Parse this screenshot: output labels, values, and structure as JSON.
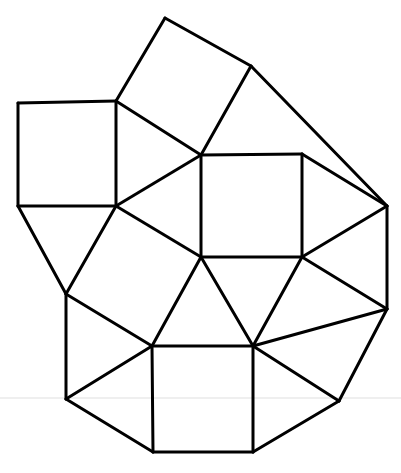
{
  "figure": {
    "background_color": "#ffffff",
    "stroke_color": "#000000",
    "stroke_width": 3,
    "canvas": {
      "width": 401,
      "height": 473
    },
    "artifact": {
      "name": "scan-line",
      "color": "#efefef",
      "y": 398,
      "x1": 0,
      "x2": 401
    },
    "vertices": {
      "A": [
        165,
        18
      ],
      "B": [
        251,
        66
      ],
      "C": [
        116,
        101
      ],
      "D": [
        18,
        103
      ],
      "E": [
        201,
        155
      ],
      "F": [
        302,
        154
      ],
      "G": [
        18,
        206
      ],
      "H": [
        116,
        206
      ],
      "I": [
        387,
        206
      ],
      "J": [
        66,
        294
      ],
      "K": [
        201,
        257
      ],
      "L": [
        302,
        257
      ],
      "M": [
        387,
        309
      ],
      "N": [
        152,
        346
      ],
      "O": [
        253,
        346
      ],
      "P": [
        66,
        399
      ],
      "Q": [
        339,
        401
      ],
      "R": [
        153,
        452
      ],
      "S": [
        253,
        452
      ]
    },
    "faces": [
      {
        "name": "tilted-square-top",
        "type": "square",
        "points": "A,B,E,C"
      },
      {
        "name": "square-upper-left",
        "type": "square",
        "points": "D,C,H,G"
      },
      {
        "name": "triangle-upper-right",
        "type": "triangle",
        "points": "B,I,F"
      },
      {
        "name": "square-center",
        "type": "square",
        "points": "E,F,L,K"
      },
      {
        "name": "triangle-upper-middle",
        "type": "triangle",
        "points": "C,E,H"
      },
      {
        "name": "triangle-left-middle",
        "type": "triangle",
        "points": "E,K,H"
      },
      {
        "name": "triangle-below-left-square",
        "type": "triangle",
        "points": "G,H,J"
      },
      {
        "name": "tilted-square-middle-left",
        "type": "square",
        "points": "H,K,N,J"
      },
      {
        "name": "triangle-center-bottom",
        "type": "triangle",
        "points": "K,L,O"
      },
      {
        "name": "triangle-right-upper",
        "type": "triangle",
        "points": "F,I,L"
      },
      {
        "name": "triangle-right-lower",
        "type": "triangle",
        "points": "L,M,O"
      },
      {
        "name": "triangle-right-edge",
        "type": "triangle",
        "points": "I,M,L"
      },
      {
        "name": "triangle-left-lower",
        "type": "triangle",
        "points": "J,N,P"
      },
      {
        "name": "square-bottom",
        "type": "square",
        "points": "N,O,S,R"
      },
      {
        "name": "triangle-bottom-left",
        "type": "triangle",
        "points": "P,R,N"
      },
      {
        "name": "triangle-bottom-right",
        "type": "triangle",
        "points": "O,Q,S"
      },
      {
        "name": "triangle-far-right-lower",
        "type": "triangle",
        "points": "M,Q,O"
      }
    ],
    "edges": [
      {
        "name": "edge-A-B",
        "from": "A",
        "to": "B"
      },
      {
        "name": "edge-A-C",
        "from": "A",
        "to": "C"
      },
      {
        "name": "edge-B-E",
        "from": "B",
        "to": "E"
      },
      {
        "name": "edge-C-E",
        "from": "C",
        "to": "E"
      },
      {
        "name": "edge-B-I",
        "from": "B",
        "to": "I"
      },
      {
        "name": "edge-D-C",
        "from": "D",
        "to": "C"
      },
      {
        "name": "edge-D-G",
        "from": "D",
        "to": "G"
      },
      {
        "name": "edge-G-H",
        "from": "G",
        "to": "H"
      },
      {
        "name": "edge-C-H",
        "from": "C",
        "to": "H"
      },
      {
        "name": "edge-E-F",
        "from": "E",
        "to": "F"
      },
      {
        "name": "edge-F-L",
        "from": "F",
        "to": "L"
      },
      {
        "name": "edge-K-L",
        "from": "K",
        "to": "L"
      },
      {
        "name": "edge-E-K",
        "from": "E",
        "to": "K"
      },
      {
        "name": "edge-E-H",
        "from": "E",
        "to": "H"
      },
      {
        "name": "edge-H-K",
        "from": "H",
        "to": "K"
      },
      {
        "name": "edge-G-J",
        "from": "G",
        "to": "J"
      },
      {
        "name": "edge-H-J",
        "from": "H",
        "to": "J"
      },
      {
        "name": "edge-J-N",
        "from": "J",
        "to": "N"
      },
      {
        "name": "edge-K-N",
        "from": "K",
        "to": "N"
      },
      {
        "name": "edge-K-O",
        "from": "K",
        "to": "O"
      },
      {
        "name": "edge-L-O",
        "from": "L",
        "to": "O"
      },
      {
        "name": "edge-F-I",
        "from": "F",
        "to": "I"
      },
      {
        "name": "edge-I-L",
        "from": "I",
        "to": "L"
      },
      {
        "name": "edge-I-M",
        "from": "I",
        "to": "M"
      },
      {
        "name": "edge-L-M",
        "from": "L",
        "to": "M"
      },
      {
        "name": "edge-M-O",
        "from": "M",
        "to": "O"
      },
      {
        "name": "edge-M-Q",
        "from": "M",
        "to": "Q"
      },
      {
        "name": "edge-O-Q",
        "from": "O",
        "to": "Q"
      },
      {
        "name": "edge-Q-S",
        "from": "Q",
        "to": "S"
      },
      {
        "name": "edge-N-O",
        "from": "N",
        "to": "O"
      },
      {
        "name": "edge-N-R",
        "from": "N",
        "to": "R"
      },
      {
        "name": "edge-O-S",
        "from": "O",
        "to": "S"
      },
      {
        "name": "edge-R-S",
        "from": "R",
        "to": "S"
      },
      {
        "name": "edge-J-P",
        "from": "J",
        "to": "P"
      },
      {
        "name": "edge-P-N",
        "from": "P",
        "to": "N"
      },
      {
        "name": "edge-P-R",
        "from": "P",
        "to": "R"
      }
    ]
  }
}
